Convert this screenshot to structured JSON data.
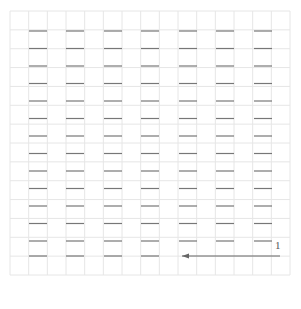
{
  "diagram": {
    "type": "dash-grid-with-arrow",
    "grid": {
      "left": 10,
      "top": 11,
      "right": 290,
      "bottom": 275,
      "columns": 15,
      "rows": 14,
      "line_color": "#e6e6e6"
    },
    "dashes": {
      "column_x_starts": [
        29,
        66,
        104,
        141,
        179,
        216,
        254
      ],
      "width": 18,
      "row_y": [
        31,
        48.5,
        66,
        83.5,
        101,
        118.5,
        136,
        153.5,
        171,
        188.5,
        206,
        223.5,
        241,
        256
      ],
      "color": "#777777",
      "omitted_in_last_row_columns": [
        4,
        5,
        6
      ]
    },
    "arrow": {
      "x1": 280,
      "y1": 256,
      "x2": 182,
      "y2": 256,
      "color": "#666666",
      "label": "1",
      "label_x": 275,
      "label_y": 242
    }
  }
}
